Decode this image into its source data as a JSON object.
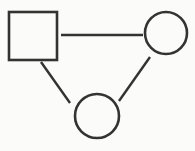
{
  "canvas": {
    "width": 195,
    "height": 151,
    "background_color": "#fbfbfa",
    "stroke_color": "#333333",
    "stroke_width": 2.5,
    "title": "Node link diagram"
  },
  "diagram": {
    "type": "node-link-graph",
    "node_count": 3,
    "edge_count": 3,
    "nodes": [
      {
        "id": "node-square",
        "shape": "square",
        "label": "",
        "x": 9,
        "y": 12,
        "width": 48,
        "height": 48,
        "center_x": 33,
        "center_y": 36,
        "fill": "none",
        "stroke": "#333333"
      },
      {
        "id": "node-circle-right",
        "shape": "circle",
        "label": "",
        "center_x": 166,
        "center_y": 33,
        "radius": 21,
        "fill": "none",
        "stroke": "#333333"
      },
      {
        "id": "node-circle-bottom",
        "shape": "circle",
        "label": "",
        "center_x": 97,
        "center_y": 116,
        "radius": 22,
        "fill": "none",
        "stroke": "#333333"
      }
    ],
    "edges": [
      {
        "id": "edge-square-to-circle-right",
        "from": "node-square",
        "to": "node-circle-right",
        "orientation": "horizontal",
        "x1": 61,
        "y1": 35,
        "x2": 143,
        "y2": 35,
        "stroke": "#333333"
      },
      {
        "id": "edge-square-to-circle-bottom",
        "from": "node-square",
        "to": "node-circle-bottom",
        "orientation": "diagonal-down-right",
        "x1": 41,
        "y1": 62,
        "x2": 70,
        "y2": 103,
        "stroke": "#333333"
      },
      {
        "id": "edge-circle-right-to-circle-bottom",
        "from": "node-circle-right",
        "to": "node-circle-bottom",
        "orientation": "diagonal-down-left",
        "x1": 150,
        "y1": 57,
        "x2": 119,
        "y2": 101,
        "stroke": "#333333"
      }
    ]
  }
}
